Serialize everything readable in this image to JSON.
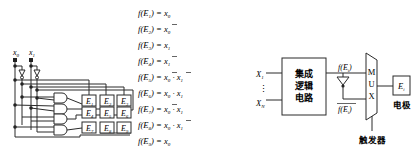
{
  "left_figure": {
    "inputs": [
      {
        "var": "x",
        "sub": "0"
      },
      {
        "var": "x",
        "sub": "1"
      }
    ],
    "electrodes": [
      {
        "label": "E",
        "sub": "1"
      },
      {
        "label": "E",
        "sub": "2"
      },
      {
        "label": "E",
        "sub": "3"
      },
      {
        "label": "E",
        "sub": "4"
      },
      {
        "label": "E",
        "sub": "5"
      },
      {
        "label": "E",
        "sub": "6"
      },
      {
        "label": "E",
        "sub": "7"
      },
      {
        "label": "E",
        "sub": "8"
      },
      {
        "label": "E",
        "sub": "9"
      }
    ],
    "gate_count": 4,
    "equations": [
      {
        "lhs": "f(E",
        "sub": "1",
        "rhs_terms": [
          {
            "v": "x",
            "s": "0",
            "bar": false
          }
        ]
      },
      {
        "lhs": "f(E",
        "sub": "2",
        "rhs_terms": [
          {
            "v": "x",
            "s": "0",
            "bar": true
          }
        ]
      },
      {
        "lhs": "f(E",
        "sub": "3",
        "rhs_terms": [
          {
            "v": "x",
            "s": "1",
            "bar": false
          }
        ]
      },
      {
        "lhs": "f(E",
        "sub": "4",
        "rhs_terms": [
          {
            "v": "x",
            "s": "1",
            "bar": true
          }
        ]
      },
      {
        "lhs": "f(E",
        "sub": "5",
        "rhs_terms": [
          {
            "v": "x",
            "s": "0",
            "bar": true
          },
          {
            "v": "x",
            "s": "1",
            "bar": true
          }
        ]
      },
      {
        "lhs": "f(E",
        "sub": "6",
        "rhs_terms": [
          {
            "v": "x",
            "s": "0",
            "bar": false
          },
          {
            "v": "x",
            "s": "1",
            "bar": false
          }
        ]
      },
      {
        "lhs": "f(E",
        "sub": "7",
        "rhs_terms": [
          {
            "v": "x",
            "s": "0",
            "bar": true
          },
          {
            "v": "x",
            "s": "1",
            "bar": false
          }
        ]
      },
      {
        "lhs": "f(E",
        "sub": "8",
        "rhs_terms": [
          {
            "v": "x",
            "s": "0",
            "bar": false
          },
          {
            "v": "x",
            "s": "1",
            "bar": true
          }
        ]
      },
      {
        "lhs": "f(E",
        "sub": "9",
        "rhs_terms": [
          {
            "v": "x",
            "s": "0",
            "bar": false
          }
        ]
      }
    ],
    "equation_text": [
      "f(E1) = x0",
      "f(E2) = x̄0",
      "f(E3) = x1",
      "f(E4) = x̄1",
      "f(E5) = x̄0 · x̄1",
      "f(E6) = x0 · x1",
      "f(E7) = x̄0 · x1",
      "f(E8) = x0 · x̄1",
      "f(E9) = x0"
    ]
  },
  "right_figure": {
    "inputs": {
      "first": "X",
      "first_sub": "1",
      "ellipsis": "⋮",
      "last": "X",
      "last_sub": "N"
    },
    "logic_block": {
      "line1": "集成",
      "line2": "逻辑",
      "line3": "电路"
    },
    "signal": {
      "label": "f(E",
      "sub": "i",
      "close": ")"
    },
    "signal_inverted": {
      "label": "f(E",
      "sub": "i",
      "close": ")"
    },
    "mux": {
      "letters": [
        "M",
        "U",
        "X"
      ]
    },
    "trigger_label": "触发器",
    "electrode": {
      "label": "E",
      "sub": "i"
    },
    "electrode_caption": "电极"
  }
}
